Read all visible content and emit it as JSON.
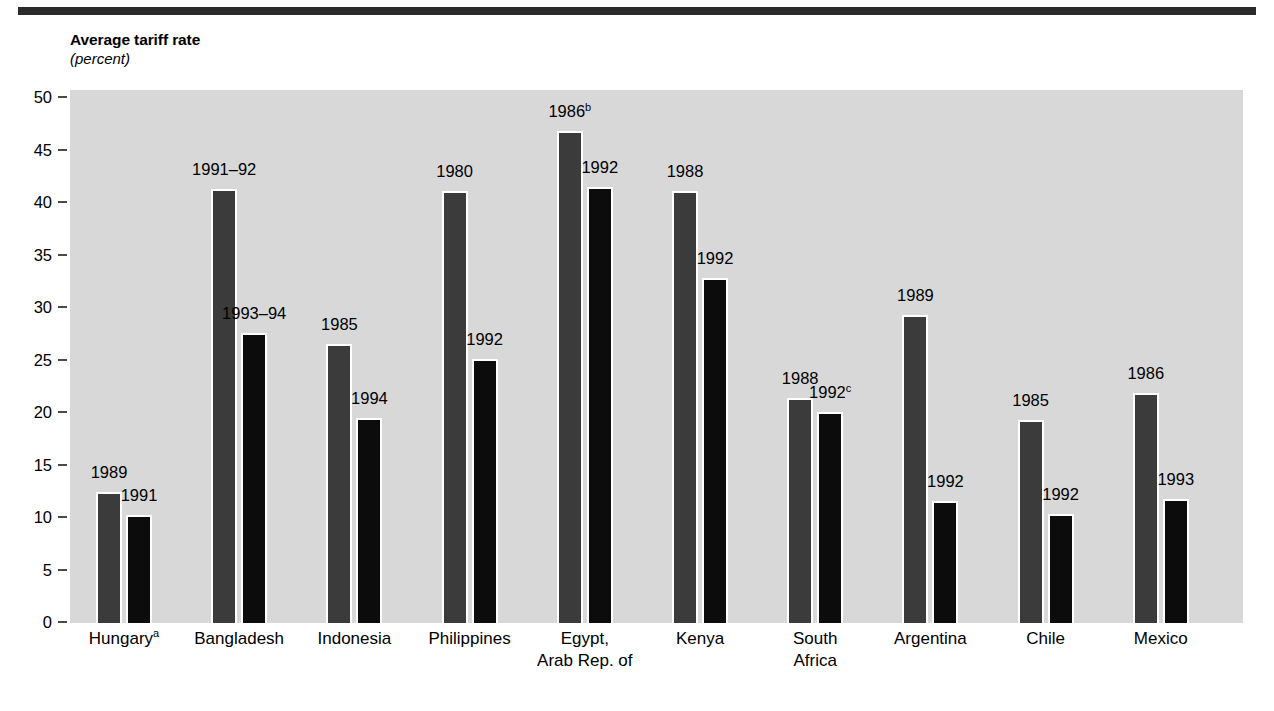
{
  "chart_data": {
    "type": "bar",
    "title": "Average tariff rate",
    "subtitle": "(percent)",
    "xlabel": "",
    "ylabel": "Average tariff rate (percent)",
    "ylim": [
      0,
      50
    ],
    "ytick_labels": [
      "50",
      "45",
      "40",
      "35",
      "30",
      "25",
      "20",
      "15",
      "10",
      "5",
      "0"
    ],
    "ytick_values": [
      50,
      45,
      40,
      35,
      30,
      25,
      20,
      15,
      10,
      5,
      0
    ],
    "grid": false,
    "legend_position": "none",
    "series": [
      {
        "name": "Earlier year",
        "color": "#3b3b3b",
        "values": [
          12.6,
          41.4,
          26.7,
          41.2,
          47.0,
          41.2,
          21.5,
          29.4,
          19.4,
          22.0
        ]
      },
      {
        "name": "Later year",
        "color": "#0c0c0c",
        "values": [
          10.4,
          27.7,
          19.6,
          25.2,
          41.6,
          33.0,
          20.2,
          11.7,
          10.5,
          11.9
        ]
      }
    ],
    "categories": [
      {
        "name": "Hungary",
        "footnote": "a",
        "lines": [
          "Hungary"
        ],
        "first_year": "1989",
        "first_year_footnote": "",
        "second_year": "1991",
        "second_year_footnote": "",
        "first_value": 12.6,
        "second_value": 10.4
      },
      {
        "name": "Bangladesh",
        "footnote": "",
        "lines": [
          "Bangladesh"
        ],
        "first_year": "1991–92",
        "first_year_footnote": "",
        "second_year": "1993–94",
        "second_year_footnote": "",
        "first_value": 41.4,
        "second_value": 27.7
      },
      {
        "name": "Indonesia",
        "footnote": "",
        "lines": [
          "Indonesia"
        ],
        "first_year": "1985",
        "first_year_footnote": "",
        "second_year": "1994",
        "second_year_footnote": "",
        "first_value": 26.7,
        "second_value": 19.6
      },
      {
        "name": "Philippines",
        "footnote": "",
        "lines": [
          "Philippines"
        ],
        "first_year": "1980",
        "first_year_footnote": "",
        "second_year": "1992",
        "second_year_footnote": "",
        "first_value": 41.2,
        "second_value": 25.2
      },
      {
        "name": "Egypt, Arab Rep. of",
        "footnote": "",
        "lines": [
          "Egypt,",
          "Arab Rep. of"
        ],
        "first_year": "1986",
        "first_year_footnote": "b",
        "second_year": "1992",
        "second_year_footnote": "",
        "first_value": 47.0,
        "second_value": 41.6
      },
      {
        "name": "Kenya",
        "footnote": "",
        "lines": [
          "Kenya"
        ],
        "first_year": "1988",
        "first_year_footnote": "",
        "second_year": "1992",
        "second_year_footnote": "",
        "first_value": 41.2,
        "second_value": 33.0
      },
      {
        "name": "South Africa",
        "footnote": "",
        "lines": [
          "South",
          "Africa"
        ],
        "first_year": "1988",
        "first_year_footnote": "",
        "second_year": "1992",
        "second_year_footnote": "c",
        "first_value": 21.5,
        "second_value": 20.2
      },
      {
        "name": "Argentina",
        "footnote": "",
        "lines": [
          "Argentina"
        ],
        "first_year": "1989",
        "first_year_footnote": "",
        "second_year": "1992",
        "second_year_footnote": "",
        "first_value": 29.4,
        "second_value": 11.7
      },
      {
        "name": "Chile",
        "footnote": "",
        "lines": [
          "Chile"
        ],
        "first_year": "1985",
        "first_year_footnote": "",
        "second_year": "1992",
        "second_year_footnote": "",
        "first_value": 19.4,
        "second_value": 10.5
      },
      {
        "name": "Mexico",
        "footnote": "",
        "lines": [
          "Mexico"
        ],
        "first_year": "1986",
        "first_year_footnote": "",
        "second_year": "1993",
        "second_year_footnote": "",
        "first_value": 22.0,
        "second_value": 11.9
      }
    ]
  },
  "colors": {
    "plot_background": "#d8d8d8",
    "page_background": "#ffffff",
    "rule": "#2b2b2b",
    "series_first": "#3b3b3b",
    "series_second": "#0c0c0c",
    "text": "#000000"
  }
}
